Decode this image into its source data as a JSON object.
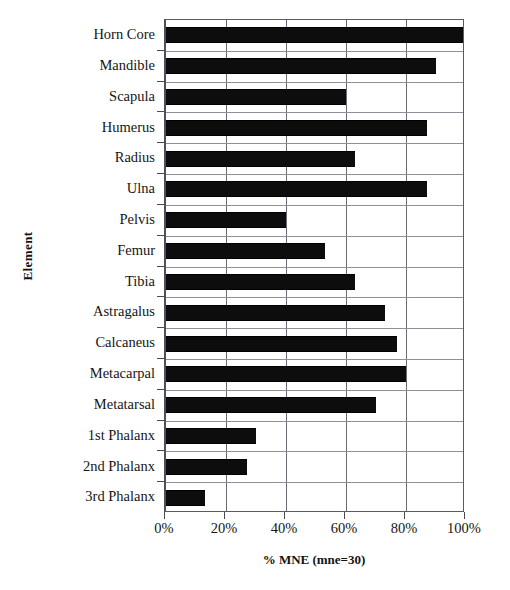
{
  "chart_data": {
    "type": "bar",
    "orientation": "horizontal",
    "title": "",
    "xlabel": "%  MNE (mne=30)",
    "ylabel": "Element",
    "xlim": [
      0,
      100
    ],
    "xtick_labels": [
      "0%",
      "20%",
      "40%",
      "60%",
      "80%",
      "100%"
    ],
    "xtick_values": [
      0,
      20,
      40,
      60,
      80,
      100
    ],
    "grid": true,
    "grid_axis": "x",
    "legend": false,
    "bar_color": "#0d0d0d",
    "categories": [
      "Horn Core",
      "Mandible",
      "Scapula",
      "Humerus",
      "Radius",
      "Ulna",
      "Pelvis",
      "Femur",
      "Tibia",
      "Astragalus",
      "Calcaneus",
      "Metacarpal",
      "Metatarsal",
      "1st Phalanx",
      "2nd Phalanx",
      "3rd Phalanx"
    ],
    "values": [
      100,
      90,
      60,
      87,
      63,
      87,
      40,
      53,
      63,
      73,
      77,
      80,
      70,
      30,
      27,
      13
    ]
  }
}
